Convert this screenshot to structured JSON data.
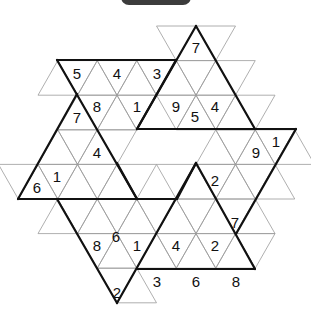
{
  "header": {
    "tab_label": ""
  },
  "puzzle": {
    "type": "triangular star sudoku",
    "givens": [
      {
        "value": "7",
        "x": 196,
        "y": 47
      },
      {
        "value": "5",
        "x": 77,
        "y": 73
      },
      {
        "value": "4",
        "x": 117,
        "y": 73
      },
      {
        "value": "3",
        "x": 157,
        "y": 73
      },
      {
        "value": "8",
        "x": 97,
        "y": 106
      },
      {
        "value": "1",
        "x": 137,
        "y": 106
      },
      {
        "value": "9",
        "x": 176,
        "y": 106
      },
      {
        "value": "5",
        "x": 195,
        "y": 116
      },
      {
        "value": "4",
        "x": 215,
        "y": 106
      },
      {
        "value": "7",
        "x": 77,
        "y": 117
      },
      {
        "value": "4",
        "x": 97,
        "y": 152
      },
      {
        "value": "9",
        "x": 256,
        "y": 152
      },
      {
        "value": "1",
        "x": 276,
        "y": 141
      },
      {
        "value": "2",
        "x": 215,
        "y": 180
      },
      {
        "value": "6",
        "x": 37,
        "y": 187
      },
      {
        "value": "1",
        "x": 57,
        "y": 176
      },
      {
        "value": "8",
        "x": 97,
        "y": 245
      },
      {
        "value": "6",
        "x": 116,
        "y": 236
      },
      {
        "value": "1",
        "x": 137,
        "y": 245
      },
      {
        "value": "4",
        "x": 176,
        "y": 245
      },
      {
        "value": "2",
        "x": 215,
        "y": 245
      },
      {
        "value": "7",
        "x": 235,
        "y": 222
      },
      {
        "value": "3",
        "x": 157,
        "y": 281
      },
      {
        "value": "6",
        "x": 196,
        "y": 281
      },
      {
        "value": "8",
        "x": 236,
        "y": 281
      },
      {
        "value": "2",
        "x": 117,
        "y": 292
      }
    ]
  },
  "colors": {
    "pill": "#3c3c3c",
    "grid": "#9a9a9a",
    "border": "#111111"
  }
}
